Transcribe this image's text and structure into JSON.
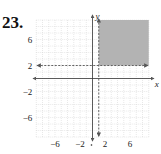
{
  "problem": {
    "number": "23."
  },
  "chart_data": {
    "type": "inequality-graph",
    "title": "",
    "xlabel": "x",
    "ylabel": "y",
    "xlim": [
      -9,
      9
    ],
    "ylim": [
      -9,
      9
    ],
    "grid": true,
    "x_ticks": [
      {
        "value": -6,
        "label": "−6"
      },
      {
        "value": -2,
        "label": "−2"
      },
      {
        "value": 2,
        "label": "2"
      },
      {
        "value": 6,
        "label": "6"
      }
    ],
    "y_ticks": [
      {
        "value": 6,
        "label": "6"
      },
      {
        "value": 2,
        "label": "2"
      },
      {
        "value": -2,
        "label": "−2"
      },
      {
        "value": -6,
        "label": "−6"
      }
    ],
    "boundaries": [
      {
        "equation": "x = 1",
        "style": "dashed",
        "arrows": "both"
      },
      {
        "equation": "y = 2",
        "style": "dashed",
        "arrows": "both"
      }
    ],
    "shaded_region": {
      "description": "x > 1 and y > 2",
      "x_range": [
        1,
        9
      ],
      "y_range": [
        2,
        9
      ],
      "color": "#b0b0b0"
    }
  },
  "colors": {
    "shade": "#b3b3b3",
    "grid": "#d0d0d0",
    "axis": "#333333",
    "boundary": "#555555"
  }
}
